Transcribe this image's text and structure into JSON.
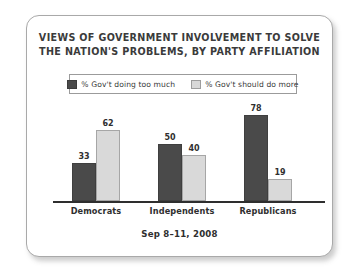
{
  "card": {
    "title_lines": [
      "VIEWS OF GOVERNMENT INVOLVEMENT TO SOLVE",
      "THE NATION'S PROBLEMS, BY PARTY AFFILIATION"
    ],
    "footer": "Sep 8–11, 2008"
  },
  "legend": {
    "entries": [
      {
        "label": "% Gov't doing too much",
        "swatch": "dark-swatch-icon",
        "color": "#4a4a4a"
      },
      {
        "label": "% Gov't should do more",
        "swatch": "light-swatch-icon",
        "color": "#d8d8d8"
      }
    ]
  },
  "chart_data": {
    "type": "bar",
    "title": "VIEWS OF GOVERNMENT INVOLVEMENT TO SOLVE THE NATION'S PROBLEMS, BY PARTY AFFILIATION",
    "subtitle": "Sep 8–11, 2008",
    "xlabel": "",
    "ylabel": "",
    "ylim": [
      0,
      85
    ],
    "grid": false,
    "legend_position": "top",
    "categories": [
      "Democrats",
      "Independents",
      "Republicans"
    ],
    "series": [
      {
        "name": "% Gov't doing too much",
        "color": "#4a4a4a",
        "values": [
          33,
          50,
          78
        ]
      },
      {
        "name": "% Gov't should do more",
        "color": "#d9d9d9",
        "values": [
          62,
          40,
          19
        ]
      }
    ]
  }
}
